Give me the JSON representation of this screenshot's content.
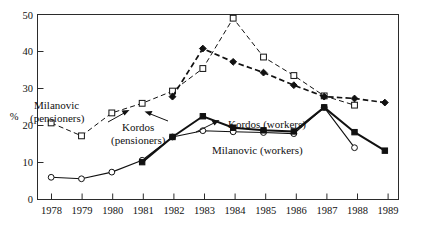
{
  "chart_data": {
    "type": "line",
    "title": "",
    "subtitle": "",
    "xlabel": "",
    "ylabel": "%",
    "categories": [
      "1978",
      "1979",
      "1980",
      "1981",
      "1982",
      "1983",
      "1984",
      "1985",
      "1986",
      "1987",
      "1988",
      "1989"
    ],
    "x": [
      1978,
      1979,
      1980,
      1981,
      1982,
      1983,
      1984,
      1985,
      1986,
      1987,
      1988,
      1989
    ],
    "xlim": [
      1977.55,
      1989.45
    ],
    "ylim": [
      0,
      50
    ],
    "yticks": [
      0,
      10,
      20,
      30,
      40,
      50
    ],
    "ytick_labels": [
      "0",
      "10",
      "20",
      "30",
      "40",
      "50"
    ],
    "xticks": [
      1978,
      1979,
      1980,
      1981,
      1982,
      1983,
      1984,
      1985,
      1986,
      1987,
      1988,
      1989
    ],
    "grid": false,
    "legend": "inline-annotations",
    "series": [
      {
        "name": "Milanovic (pensioners)",
        "marker": "open-square",
        "line": "dashed",
        "weight": "thin",
        "x": [
          1978,
          1979,
          1980,
          1981,
          1982,
          1983,
          1984,
          1985,
          1986,
          1987,
          1988
        ],
        "values": [
          20.7,
          17.2,
          23.4,
          26.0,
          29.3,
          35.4,
          49.0,
          38.5,
          33.5,
          28.0,
          25.5
        ],
        "values_by_year": {
          "1978": 20.7,
          "1979": 17.2,
          "1980": 23.4,
          "1981": 26.0,
          "1982": 29.3,
          "1983": 35.4,
          "1984": 49.0,
          "1985": 38.5,
          "1986": 33.5,
          "1987": 28.0,
          "1988": 25.5
        }
      },
      {
        "name": "Kordos (pensioners)",
        "marker": "filled-diamond",
        "line": "dashed",
        "weight": "bold",
        "x": [
          1982,
          1983,
          1984,
          1985,
          1986,
          1987,
          1988,
          1989
        ],
        "values": [
          27.8,
          40.8,
          37.2,
          34.3,
          30.9,
          27.8,
          27.3,
          26.2
        ],
        "values_by_year": {
          "1982": 27.8,
          "1983": 40.8,
          "1984": 37.2,
          "1985": 34.3,
          "1986": 30.9,
          "1987": 27.8,
          "1988": 27.3,
          "1989": 26.2
        }
      },
      {
        "name": "Kordos (workers)",
        "marker": "filled-square",
        "line": "solid",
        "weight": "bold",
        "x": [
          1981,
          1982,
          1983,
          1984,
          1985,
          1986,
          1987,
          1988,
          1989
        ],
        "values": [
          10.1,
          16.9,
          22.5,
          19.4,
          18.7,
          18.4,
          24.9,
          18.2,
          13.2
        ],
        "values_by_year": {
          "1981": 10.1,
          "1982": 16.9,
          "1983": 22.5,
          "1984": 19.4,
          "1985": 18.7,
          "1986": 18.4,
          "1987": 24.9,
          "1988": 18.2,
          "1989": 13.2
        }
      },
      {
        "name": "Milanovic (workers)",
        "marker": "open-circle",
        "line": "solid",
        "weight": "thin",
        "x": [
          1978,
          1979,
          1980,
          1981,
          1982,
          1983,
          1984,
          1985,
          1986,
          1987,
          1988
        ],
        "values": [
          6.0,
          5.6,
          7.4,
          10.6,
          16.9,
          18.6,
          18.3,
          18.1,
          17.8,
          24.9,
          14.0
        ],
        "values_by_year": {
          "1978": 6.0,
          "1979": 5.6,
          "1980": 7.4,
          "1981": 10.6,
          "1982": 16.9,
          "1983": 18.6,
          "1984": 18.3,
          "1985": 18.1,
          "1986": 17.8,
          "1987": 24.9,
          "1988": 14.0
        }
      }
    ],
    "annotations": [
      {
        "id": "milanovic-pensioners",
        "lines": [
          "Milanovic",
          "(pensioners)"
        ],
        "has_leader": true
      },
      {
        "id": "kordos-pensioners",
        "lines": [
          "Kordos",
          "(pensioners)"
        ],
        "has_leader": true
      },
      {
        "id": "kordos-workers",
        "lines": [
          "Kordos (workers)"
        ],
        "has_leader": false
      },
      {
        "id": "milanovic-workers",
        "lines": [
          "Milanovic (workers)"
        ],
        "has_leader": false
      }
    ]
  },
  "axes": {
    "y_unit_label": "%",
    "y_tick_labels": [
      "0",
      "10",
      "20",
      "30",
      "40",
      "50"
    ],
    "x_tick_labels": [
      "1978",
      "1979",
      "1980",
      "1981",
      "1982",
      "1983",
      "1984",
      "1985",
      "1986",
      "1987",
      "1988",
      "1989"
    ]
  },
  "labels": {
    "milanovic_pensioners_l1": "Milanovic",
    "milanovic_pensioners_l2": "(pensioners)",
    "kordos_pensioners_l1": "Kordos",
    "kordos_pensioners_l2": "(pensioners)",
    "kordos_workers": "Kordos (workers)",
    "milanovic_workers": "Milanovic (workers)"
  },
  "colors": {
    "ink": "#111111",
    "frame": "#2b2b2b",
    "background": "#ffffff",
    "marker_fill_open": "#ffffff"
  }
}
